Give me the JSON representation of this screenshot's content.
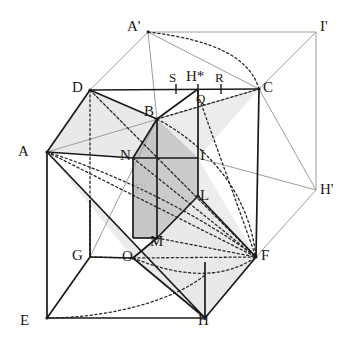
{
  "figure": {
    "type": "geometry-diagram",
    "width": 347,
    "height": 342,
    "colors": {
      "background": "#ffffff",
      "stroke_dark": "#1a1a1a",
      "stroke_light": "#9a9a9a",
      "fill_light": "#e7e7e7",
      "fill_mid": "#dedede",
      "fill_dark": "#c2c2c2",
      "label": "#1a1a1a",
      "label_faint": "#b5b5b5"
    },
    "vertices": [
      {
        "name": "A",
        "label": "A",
        "x": 47,
        "y": 152,
        "lx": 18,
        "ly": 144,
        "faint": false
      },
      {
        "name": "D",
        "label": "D",
        "x": 90,
        "y": 90,
        "lx": 72,
        "ly": 80,
        "faint": false
      },
      {
        "name": "C",
        "label": "C",
        "x": 259,
        "y": 89,
        "lx": 263,
        "ly": 80,
        "faint": false
      },
      {
        "name": "B",
        "label": "B",
        "x": 157,
        "y": 119,
        "lx": 144,
        "ly": 104,
        "faint": false
      },
      {
        "name": "E",
        "label": "E",
        "x": 47,
        "y": 318,
        "lx": 20,
        "ly": 313,
        "faint": false
      },
      {
        "name": "G",
        "label": "G",
        "x": 90,
        "y": 257,
        "lx": 72,
        "ly": 248,
        "faint": false
      },
      {
        "name": "O",
        "label": "O",
        "x": 133,
        "y": 258,
        "lx": 122,
        "ly": 249,
        "faint": false
      },
      {
        "name": "H",
        "label": "H",
        "x": 205,
        "y": 318,
        "lx": 198,
        "ly": 313,
        "faint": false
      },
      {
        "name": "F",
        "label": "F",
        "x": 256,
        "y": 257,
        "lx": 261,
        "ly": 248,
        "faint": false
      },
      {
        "name": "Ap",
        "label": "A'",
        "x": 148,
        "y": 32,
        "lx": 127,
        "ly": 19,
        "faint": false
      },
      {
        "name": "Ip",
        "label": "I'",
        "x": 316,
        "y": 32,
        "lx": 320,
        "ly": 19,
        "faint": false
      },
      {
        "name": "Hp",
        "label": "H'",
        "x": 316,
        "y": 190,
        "lx": 320,
        "ly": 182,
        "faint": false
      },
      {
        "name": "N",
        "label": "N",
        "x": 133,
        "y": 158,
        "lx": 120,
        "ly": 148,
        "faint": false
      },
      {
        "name": "I",
        "label": "I",
        "x": 198,
        "y": 158,
        "lx": 200,
        "ly": 148,
        "faint": false
      },
      {
        "name": "L",
        "label": "L",
        "x": 198,
        "y": 196,
        "lx": 200,
        "ly": 188,
        "faint": false
      },
      {
        "name": "M",
        "label": "M",
        "x": 157,
        "y": 238,
        "lx": 150,
        "ly": 234,
        "faint": false
      },
      {
        "name": "Q",
        "label": "Q",
        "x": 198,
        "y": 95,
        "lx": 196,
        "ly": 91,
        "faint": false
      },
      {
        "name": "Ep",
        "label": "E'",
        "x": 143,
        "y": 192,
        "lx": 134,
        "ly": 182,
        "faint": true
      }
    ],
    "edge_ticks": [
      {
        "name": "S",
        "label": "S",
        "x": 176,
        "y": 89,
        "lx": 168,
        "ly": 73
      },
      {
        "name": "Hs",
        "label": "H*",
        "x": 198,
        "y": 89,
        "lx": 186,
        "ly": 72
      },
      {
        "name": "R",
        "label": "R",
        "x": 221,
        "y": 89,
        "lx": 214,
        "ly": 73
      }
    ]
  }
}
